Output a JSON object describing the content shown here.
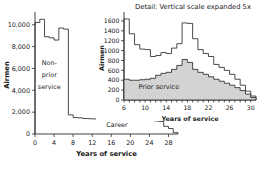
{
  "figure": {
    "background_color": "#ffffff",
    "axis_color": "#2b2b2b",
    "fill_color": "#d3d3d3"
  },
  "main_chart": {
    "ylabel": "Airmen",
    "xlabel": "Years of service",
    "annotation_nonprior": "Non-\nprior\nservice",
    "annotation_nonprior_line1": "Non-",
    "annotation_nonprior_line2": "prior",
    "annotation_nonprior_line3": "service",
    "annotation_career": "Career",
    "ytick_labels": [
      "0",
      "2,000",
      "4,000",
      "6,000",
      "8,000",
      "10,000"
    ],
    "xtick_labels": [
      "0",
      "4",
      "8",
      "12",
      "16",
      "20",
      "24",
      "28"
    ]
  },
  "inset_chart": {
    "title": "Detail: Vertical scale expanded 5x",
    "ylabel": "Airmen",
    "xlabel": "Years of service",
    "annotation_prior": "Prior service",
    "ytick_labels": [
      "0",
      "200",
      "400",
      "600",
      "800",
      "1000",
      "1200",
      "1400",
      "1600"
    ],
    "xtick_labels": [
      "6",
      "10",
      "14",
      "18",
      "22",
      "26",
      "30"
    ]
  },
  "chart_data": [
    {
      "id": "main",
      "type": "bar",
      "title": "",
      "subtitle": "",
      "xlabel": "Years of service",
      "ylabel": "Airmen",
      "xlim": [
        0,
        30
      ],
      "ylim": [
        0,
        10800
      ],
      "grid": false,
      "legend": false,
      "annotations": [
        {
          "text": "Non-prior service",
          "x": 3,
          "y": 5200
        },
        {
          "text": "Career",
          "x": 17,
          "y": 900
        }
      ],
      "xticks": [
        0,
        4,
        8,
        12,
        16,
        20,
        24,
        28
      ],
      "yticks": [
        0,
        2000,
        4000,
        6000,
        8000,
        10000
      ],
      "ytick_labels": [
        "0",
        "2,000",
        "4,000",
        "6,000",
        "8,000",
        "10,000"
      ],
      "categories": [
        0,
        1,
        2,
        3,
        4,
        5,
        6,
        7,
        8,
        9,
        10,
        11,
        12,
        13,
        14,
        15,
        16,
        17,
        18,
        19,
        20,
        21,
        22,
        23,
        24,
        25,
        26,
        27,
        28,
        29
      ],
      "series": [
        {
          "name": "Airmen by years of service",
          "values": [
            10200,
            10500,
            8900,
            8800,
            8600,
            9700,
            9600,
            1750,
            1500,
            1480,
            1420,
            1400,
            1380,
            1340,
            1380,
            1450,
            1700,
            1900,
            1950,
            1800,
            1750,
            1400,
            1350,
            1300,
            1280,
            1200,
            1150,
            700,
            500,
            120
          ]
        }
      ]
    },
    {
      "id": "inset",
      "type": "area",
      "title": "Detail: Vertical scale expanded 5x",
      "xlabel": "Years of service",
      "ylabel": "Airmen",
      "xlim": [
        6,
        31
      ],
      "ylim": [
        0,
        1700
      ],
      "grid": false,
      "legend": false,
      "annotations": [
        {
          "text": "Prior service",
          "x": 12,
          "y": 260
        }
      ],
      "xticks": [
        6,
        10,
        14,
        18,
        22,
        26,
        30
      ],
      "yticks": [
        0,
        200,
        400,
        600,
        800,
        1000,
        1200,
        1400,
        1600
      ],
      "categories": [
        6,
        7,
        8,
        9,
        10,
        11,
        12,
        13,
        14,
        15,
        16,
        17,
        18,
        19,
        20,
        21,
        22,
        23,
        24,
        25,
        26,
        27,
        28,
        29,
        30
      ],
      "series": [
        {
          "name": "Total",
          "fill": "none",
          "values": [
            1640,
            1340,
            1120,
            1030,
            1020,
            880,
            900,
            960,
            940,
            1050,
            1140,
            1560,
            1550,
            1240,
            1020,
            940,
            880,
            720,
            660,
            600,
            520,
            420,
            300,
            180,
            80
          ]
        },
        {
          "name": "Prior service",
          "fill": "#d3d3d3",
          "values": [
            420,
            400,
            400,
            410,
            420,
            440,
            500,
            540,
            560,
            620,
            700,
            820,
            760,
            620,
            560,
            520,
            470,
            420,
            380,
            340,
            300,
            250,
            190,
            120,
            50
          ]
        }
      ]
    }
  ]
}
